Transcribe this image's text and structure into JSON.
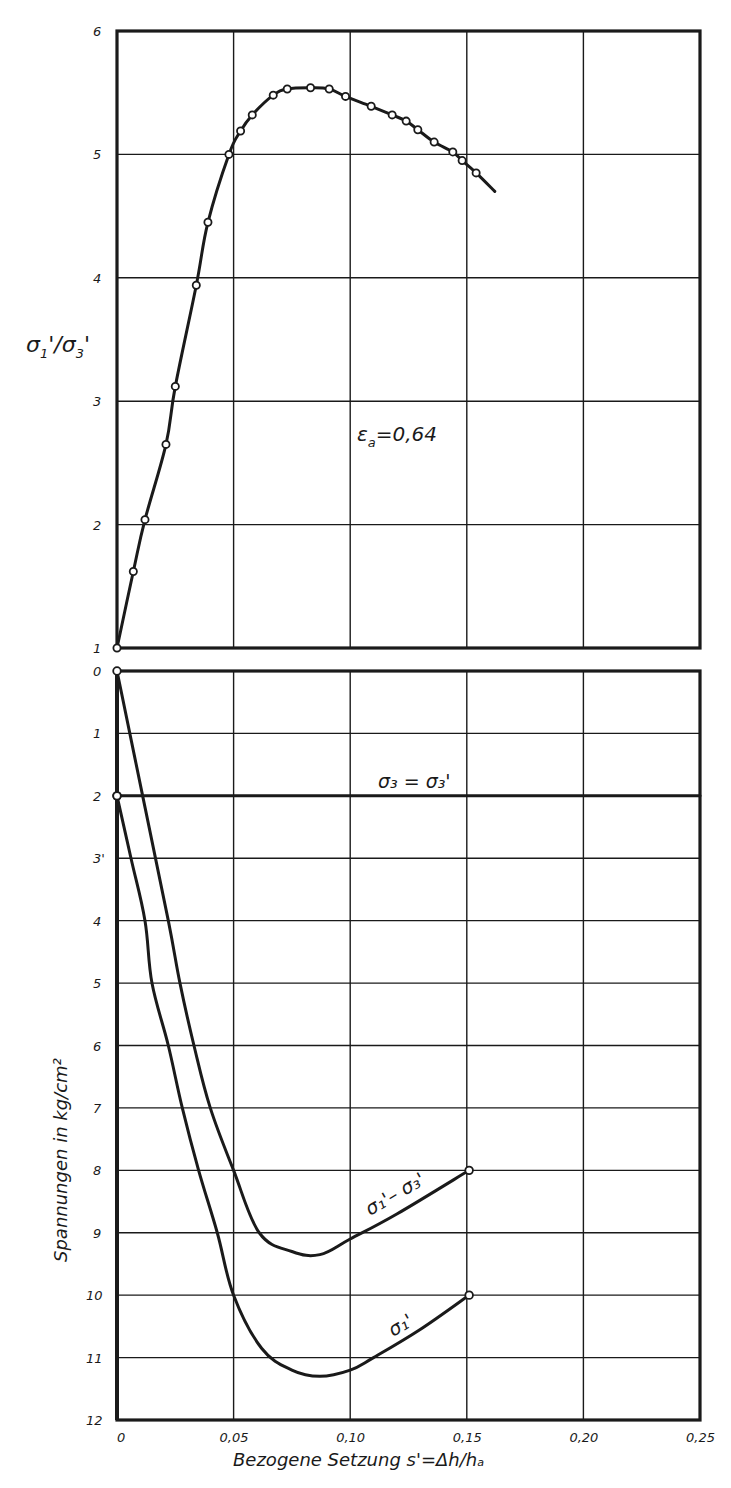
{
  "chart_data": [
    {
      "panel": "top",
      "type": "line",
      "ylabel": "σ₁'/σ₃'",
      "xlim": [
        0,
        0.25
      ],
      "ylim": [
        1,
        6
      ],
      "xticks": [
        0,
        0.05,
        0.1,
        0.15,
        0.2,
        0.25
      ],
      "yticks": [
        1,
        2,
        3,
        4,
        5,
        6
      ],
      "ytick_labels": [
        "1",
        "2",
        "3",
        "4",
        "5",
        "6"
      ],
      "grid": true,
      "annotation": "εa=0,64",
      "series": [
        {
          "name": "σ1'/σ3'",
          "markers": true,
          "x": [
            0,
            0.007,
            0.012,
            0.021,
            0.025,
            0.034,
            0.039,
            0.048,
            0.053,
            0.058,
            0.067,
            0.073,
            0.083,
            0.091,
            0.098,
            0.109,
            0.118,
            0.124,
            0.129,
            0.136,
            0.144,
            0.148,
            0.154
          ],
          "y": [
            1.0,
            1.62,
            2.04,
            2.65,
            3.12,
            3.94,
            4.45,
            5.0,
            5.19,
            5.32,
            5.48,
            5.53,
            5.54,
            5.53,
            5.47,
            5.39,
            5.32,
            5.27,
            5.2,
            5.1,
            5.02,
            4.95,
            4.85
          ],
          "line_end": [
            0.162,
            4.7
          ]
        }
      ]
    },
    {
      "panel": "bottom",
      "type": "line",
      "ylabel": "Spannungen in kg/cm²",
      "xlabel": "Bezogene Setzung s'=Δh/ha",
      "xlim": [
        0,
        0.25
      ],
      "ylim": [
        12,
        0
      ],
      "y_inverted": true,
      "xticks": [
        0,
        0.05,
        0.1,
        0.15,
        0.2,
        0.25
      ],
      "xtick_labels": [
        "0",
        "0,05",
        "0,10",
        "0,15",
        "0,20",
        "0,25"
      ],
      "yticks": [
        0,
        1,
        2,
        3,
        4,
        5,
        6,
        7,
        8,
        9,
        10,
        11,
        12
      ],
      "ytick_labels": [
        "0",
        "1",
        "2",
        "3'",
        "4",
        "5",
        "6",
        "7",
        "8",
        "9",
        "10",
        "11",
        "12"
      ],
      "grid": true,
      "series": [
        {
          "name": "σ3 = σ3'",
          "x": [
            0,
            0.25
          ],
          "y": [
            2,
            2
          ],
          "markers_at": [
            [
              0,
              2
            ]
          ]
        },
        {
          "name": "σ1' − σ3'",
          "x": [
            0,
            0.011,
            0.022,
            0.027,
            0.033,
            0.04,
            0.05,
            0.061,
            0.075,
            0.087,
            0.1,
            0.12,
            0.151
          ],
          "y": [
            0,
            2,
            4,
            5,
            6,
            7,
            8,
            9,
            9.3,
            9.35,
            9.1,
            8.7,
            8.0
          ],
          "markers_at": [
            [
              0,
              0
            ],
            [
              0.151,
              8.0
            ]
          ]
        },
        {
          "name": "σ1'",
          "x": [
            0,
            0.006,
            0.012,
            0.015,
            0.022,
            0.028,
            0.035,
            0.043,
            0.05,
            0.062,
            0.075,
            0.087,
            0.1,
            0.11,
            0.13,
            0.151
          ],
          "y": [
            2,
            3,
            4,
            5,
            6,
            7,
            8,
            9,
            10,
            10.85,
            11.2,
            11.3,
            11.2,
            11.0,
            10.55,
            10.0
          ],
          "markers_at": [
            [
              0,
              2
            ],
            [
              0.151,
              10.0
            ]
          ]
        }
      ]
    }
  ],
  "labels": {
    "top_ylabel_main": "σ",
    "top_ylabel_sub1": "1",
    "top_ylabel_sub3": "3",
    "annotation_eps": "ε",
    "annotation_eps_sub": "a",
    "annotation_eps_val": "=0,64",
    "sigma3_label": "σ₃ = σ₃'",
    "diff_label": "σ₁'– σ₃'",
    "s1_label": "σ₁'",
    "bottom_ylabel": "Spannungen in kg/cm²",
    "xlabel": "Bezogene Setzung  s'=Δh/hₐ"
  }
}
